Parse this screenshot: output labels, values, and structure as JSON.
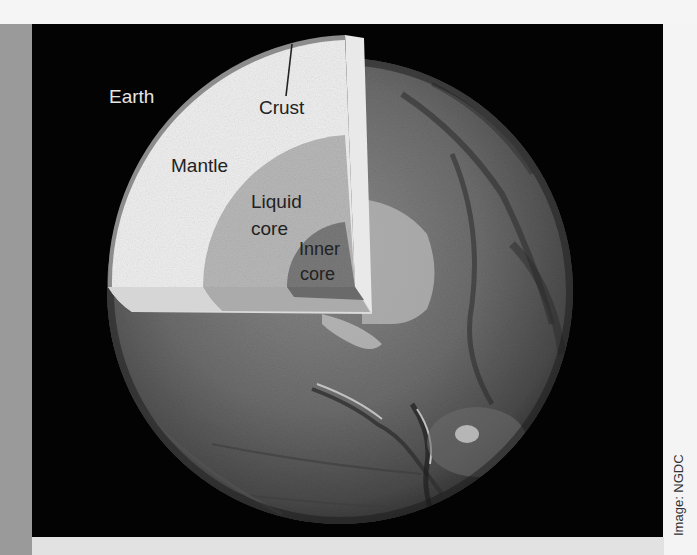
{
  "diagram": {
    "title_label": "Earth",
    "layers": [
      {
        "id": "crust",
        "label": "Crust",
        "color": "#8c8c8c"
      },
      {
        "id": "mantle",
        "label": "Mantle",
        "color": "#f0f0f0"
      },
      {
        "id": "liquid-core",
        "label_line1": "Liquid",
        "label_line2": "core",
        "color": "#b9b9b9"
      },
      {
        "id": "inner-core",
        "label_line1": "Inner",
        "label_line2": "core",
        "color": "#7a7a7a"
      }
    ],
    "background_color": "#030303"
  },
  "credit": "Image: NGDC"
}
